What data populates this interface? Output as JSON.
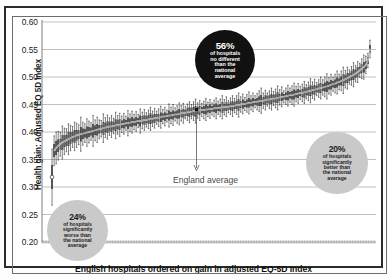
{
  "chart_data": {
    "type": "line",
    "title": "",
    "subtitle": "",
    "xlabel": "English hospitals ordered on gain in adjusted EQ-5D Index",
    "ylabel": "Health gain: Adjusted EQ 5D Index",
    "ylim": [
      0.2,
      0.6
    ],
    "yticks": [
      0.6,
      0.55,
      0.5,
      0.45,
      0.4,
      0.35,
      0.3,
      0.25,
      0.2
    ],
    "ytick_labels": [
      "0.60",
      "0.55",
      "0.50",
      "0.45",
      "0.40",
      "0.35",
      "0.30",
      "0.25",
      "0.20"
    ],
    "xticks": [],
    "xtick_labels": [],
    "grid": "horizontal",
    "legend_position": "none",
    "series_description": "Caterpillar plot: per-hospital adjusted EQ-5D health gain point estimate with 95% confidence interval bars, hospitals sorted ascending by gain.",
    "england_average": 0.4405,
    "n_hospitals": 156,
    "series": [
      {
        "name": "Adjusted EQ-5D health gain (point estimate)",
        "marker": "open-circle-first-then-filled",
        "values": [
          0.318,
          0.366,
          0.371,
          0.375,
          0.378,
          0.381,
          0.383,
          0.385,
          0.387,
          0.389,
          0.391,
          0.392,
          0.394,
          0.395,
          0.396,
          0.397,
          0.398,
          0.399,
          0.4,
          0.401,
          0.402,
          0.403,
          0.404,
          0.405,
          0.406,
          0.407,
          0.408,
          0.409,
          0.41,
          0.41,
          0.411,
          0.412,
          0.413,
          0.413,
          0.414,
          0.415,
          0.416,
          0.416,
          0.417,
          0.418,
          0.418,
          0.419,
          0.42,
          0.42,
          0.421,
          0.422,
          0.422,
          0.423,
          0.424,
          0.424,
          0.425,
          0.426,
          0.426,
          0.427,
          0.428,
          0.428,
          0.429,
          0.43,
          0.43,
          0.431,
          0.432,
          0.432,
          0.433,
          0.434,
          0.434,
          0.435,
          0.436,
          0.436,
          0.437,
          0.438,
          0.438,
          0.439,
          0.439,
          0.44,
          0.44,
          0.441,
          0.441,
          0.442,
          0.442,
          0.443,
          0.443,
          0.444,
          0.444,
          0.445,
          0.445,
          0.446,
          0.446,
          0.447,
          0.447,
          0.448,
          0.449,
          0.449,
          0.45,
          0.451,
          0.451,
          0.452,
          0.453,
          0.453,
          0.454,
          0.455,
          0.455,
          0.456,
          0.457,
          0.457,
          0.458,
          0.459,
          0.459,
          0.46,
          0.461,
          0.461,
          0.462,
          0.463,
          0.464,
          0.464,
          0.465,
          0.466,
          0.467,
          0.467,
          0.468,
          0.469,
          0.47,
          0.471,
          0.471,
          0.472,
          0.473,
          0.474,
          0.475,
          0.476,
          0.477,
          0.478,
          0.479,
          0.48,
          0.481,
          0.482,
          0.483,
          0.484,
          0.486,
          0.487,
          0.488,
          0.49,
          0.491,
          0.493,
          0.494,
          0.496,
          0.498,
          0.5,
          0.502,
          0.504,
          0.506,
          0.509,
          0.512,
          0.515,
          0.518,
          0.522,
          0.53,
          0.551
        ]
      },
      {
        "name": "95% CI half-width",
        "values": [
          0.051,
          0.027,
          0.029,
          0.026,
          0.022,
          0.03,
          0.024,
          0.021,
          0.028,
          0.023,
          0.019,
          0.026,
          0.022,
          0.018,
          0.031,
          0.021,
          0.017,
          0.025,
          0.02,
          0.016,
          0.028,
          0.019,
          0.023,
          0.017,
          0.015,
          0.026,
          0.018,
          0.022,
          0.016,
          0.02,
          0.014,
          0.024,
          0.017,
          0.021,
          0.015,
          0.019,
          0.013,
          0.023,
          0.016,
          0.02,
          0.014,
          0.018,
          0.012,
          0.022,
          0.015,
          0.019,
          0.013,
          0.017,
          0.021,
          0.014,
          0.018,
          0.012,
          0.016,
          0.02,
          0.013,
          0.017,
          0.011,
          0.021,
          0.015,
          0.019,
          0.012,
          0.016,
          0.02,
          0.014,
          0.018,
          0.011,
          0.015,
          0.019,
          0.013,
          0.017,
          0.022,
          0.014,
          0.018,
          0.012,
          0.016,
          0.02,
          0.013,
          0.017,
          0.011,
          0.015,
          0.019,
          0.012,
          0.016,
          0.021,
          0.014,
          0.018,
          0.011,
          0.015,
          0.019,
          0.013,
          0.017,
          0.022,
          0.014,
          0.018,
          0.012,
          0.016,
          0.02,
          0.013,
          0.017,
          0.011,
          0.015,
          0.019,
          0.023,
          0.014,
          0.018,
          0.012,
          0.016,
          0.02,
          0.013,
          0.017,
          0.022,
          0.014,
          0.018,
          0.011,
          0.015,
          0.019,
          0.013,
          0.017,
          0.021,
          0.014,
          0.018,
          0.012,
          0.016,
          0.02,
          0.013,
          0.017,
          0.022,
          0.015,
          0.019,
          0.012,
          0.016,
          0.02,
          0.014,
          0.018,
          0.023,
          0.015,
          0.019,
          0.013,
          0.017,
          0.021,
          0.014,
          0.018,
          0.024,
          0.016,
          0.02,
          0.013,
          0.017,
          0.022,
          0.015,
          0.019,
          0.013,
          0.018,
          0.022,
          0.016,
          0.013,
          0.016
        ]
      }
    ]
  },
  "annotations": {
    "england_average_label": "England average",
    "bubbles": [
      {
        "id": "no-different",
        "pct": "56%",
        "line1": "of hospitals",
        "line2": "no different",
        "line3": "than the",
        "line4": "national",
        "line5": "average",
        "color": "#111111",
        "text_color": "#ffffff"
      },
      {
        "id": "worse",
        "pct": "24%",
        "line1": "of hospitals",
        "line2": "significantly",
        "line3": "worse than",
        "line4": "the national",
        "line5": "average",
        "color": "#c9c9c9",
        "text_color": "#1b1b1b"
      },
      {
        "id": "better",
        "pct": "20%",
        "line1": "of hospitals",
        "line2": "significantly",
        "line3": "better than",
        "line4": "the national",
        "line5": "average",
        "color": "#c9c9c9",
        "text_color": "#1b1b1b"
      }
    ]
  },
  "style": {
    "grid_color": "#b9b9b9",
    "bar_fill": "#9a9a9a",
    "bar_line": "#1a1a1a",
    "frame_color": "#2b2b2b",
    "axis_text": "#1b1b1b"
  }
}
